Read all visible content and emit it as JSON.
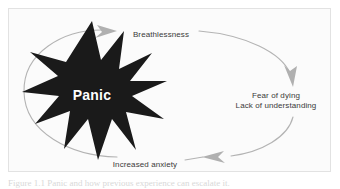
{
  "figure": {
    "caption": "Figure 1.1   Panic and how previous experience can escalate it.",
    "frame_background": "#fbfbfb",
    "frame_border_color": "#e2e2e2",
    "page_background": "#ffffff"
  },
  "diagram": {
    "type": "cycle",
    "direction": "clockwise",
    "loop_color": "#b3b3b3",
    "arrow_color": "#b0b0b0",
    "label_color": "#3a3a3a",
    "center_node": {
      "label": "Panic",
      "shape": "10-point-starburst",
      "fill": "#1a1a1a",
      "text_color": "#ffffff"
    },
    "nodes": [
      {
        "id": "breathlessness",
        "label": "Breathlessness",
        "position": "top"
      },
      {
        "id": "fear",
        "label_line_1": "Fear of dying",
        "label_line_2": "Lack of understanding",
        "position": "right"
      },
      {
        "id": "anxiety",
        "label": "Increased anxiety",
        "position": "bottom"
      }
    ],
    "arrows": [
      {
        "id": "arrow-to-breathlessness",
        "points": "right",
        "position": "top-left"
      },
      {
        "id": "arrow-to-fear",
        "points": "down-right",
        "position": "right"
      },
      {
        "id": "arrow-to-anxiety",
        "points": "left",
        "position": "bottom-right"
      }
    ]
  }
}
